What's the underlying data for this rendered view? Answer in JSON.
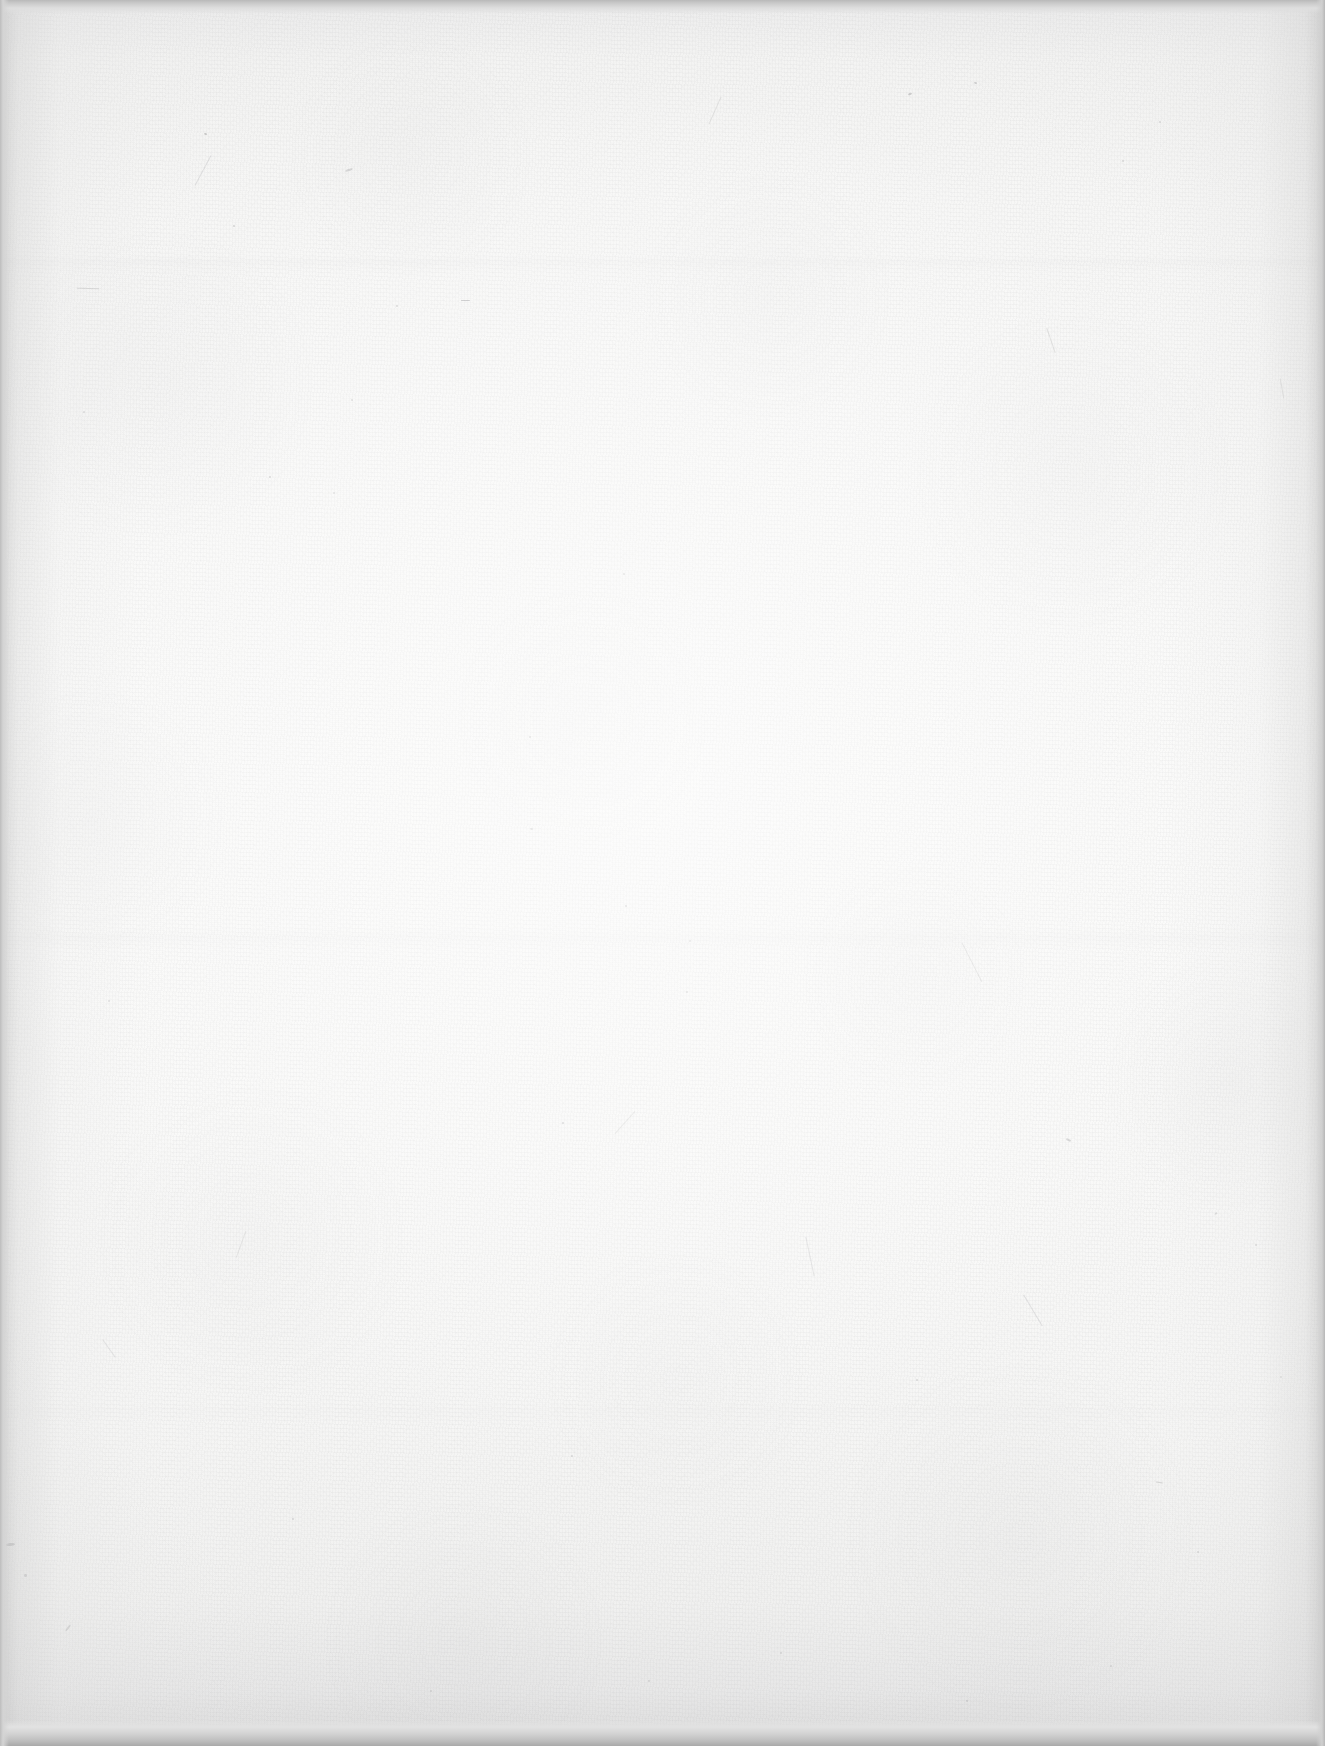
{
  "page": {
    "kind": "blank-scanned-page",
    "visible_text": "",
    "page_number": "",
    "header_text": "",
    "footer_text": "",
    "width_px": 1325,
    "height_px": 1746
  },
  "appearance": {
    "paper_base_color": "#fafaf9",
    "paper_edge_color": "#e8e8e8",
    "center_highlight_color": "#ffffff",
    "scanner_band_top_color": "#b9b9b9",
    "scanner_band_bottom_color": "#a9a9a9",
    "vignette_color": "#c4c4c4",
    "fiber_speck_color": "#8e8e90",
    "texture": "laid paper fibers with scattered dark specks",
    "lighting": "brightest near center, darkening toward all four edges"
  },
  "artifacts": {
    "specks": [
      {
        "x": 204,
        "y": 133,
        "w": 3,
        "h": 2,
        "rot": 18,
        "opacity": 0.42
      },
      {
        "x": 233,
        "y": 225,
        "w": 2,
        "h": 2,
        "rot": 0,
        "opacity": 0.35
      },
      {
        "x": 77,
        "y": 288,
        "w": 22,
        "h": 1,
        "rot": 2,
        "opacity": 0.3
      },
      {
        "x": 396,
        "y": 305,
        "w": 2,
        "h": 2,
        "rot": 0,
        "opacity": 0.33
      },
      {
        "x": 461,
        "y": 300,
        "w": 9,
        "h": 1,
        "rot": 1,
        "opacity": 0.46
      },
      {
        "x": 351,
        "y": 399,
        "w": 2,
        "h": 2,
        "rot": 0,
        "opacity": 0.28
      },
      {
        "x": 909,
        "y": 92,
        "w": 2,
        "h": 4,
        "rot": 65,
        "opacity": 0.4
      },
      {
        "x": 974,
        "y": 82,
        "w": 3,
        "h": 2,
        "rot": 20,
        "opacity": 0.36
      },
      {
        "x": 1122,
        "y": 160,
        "w": 2,
        "h": 2,
        "rot": 0,
        "opacity": 0.3
      },
      {
        "x": 1159,
        "y": 121,
        "w": 2,
        "h": 2,
        "rot": 0,
        "opacity": 0.27
      },
      {
        "x": 348,
        "y": 166,
        "w": 2,
        "h": 8,
        "rot": 72,
        "opacity": 0.31
      },
      {
        "x": 83,
        "y": 411,
        "w": 2,
        "h": 2,
        "rot": 0,
        "opacity": 0.29
      },
      {
        "x": 269,
        "y": 476,
        "w": 2,
        "h": 2,
        "rot": 0,
        "opacity": 0.34
      },
      {
        "x": 333,
        "y": 492,
        "w": 2,
        "h": 2,
        "rot": 0,
        "opacity": 0.26
      },
      {
        "x": 623,
        "y": 573,
        "w": 2,
        "h": 2,
        "rot": 0,
        "opacity": 0.3
      },
      {
        "x": 529,
        "y": 736,
        "w": 2,
        "h": 2,
        "rot": 0,
        "opacity": 0.32
      },
      {
        "x": 530,
        "y": 828,
        "w": 3,
        "h": 2,
        "rot": 14,
        "opacity": 0.3
      },
      {
        "x": 625,
        "y": 905,
        "w": 2,
        "h": 2,
        "rot": 0,
        "opacity": 0.36
      },
      {
        "x": 689,
        "y": 940,
        "w": 2,
        "h": 2,
        "rot": 0,
        "opacity": 0.28
      },
      {
        "x": 562,
        "y": 1122,
        "w": 2,
        "h": 2,
        "rot": 0,
        "opacity": 0.38
      },
      {
        "x": 686,
        "y": 991,
        "w": 2,
        "h": 2,
        "rot": 0,
        "opacity": 0.3
      },
      {
        "x": 1066,
        "y": 1139,
        "w": 5,
        "h": 2,
        "rot": 24,
        "opacity": 0.34
      },
      {
        "x": 1255,
        "y": 1244,
        "w": 2,
        "h": 2,
        "rot": 0,
        "opacity": 0.31
      },
      {
        "x": 1280,
        "y": 1376,
        "w": 2,
        "h": 2,
        "rot": 0,
        "opacity": 0.26
      },
      {
        "x": 1215,
        "y": 1212,
        "w": 2,
        "h": 3,
        "rot": 55,
        "opacity": 0.29
      },
      {
        "x": 916,
        "y": 1379,
        "w": 2,
        "h": 2,
        "rot": 0,
        "opacity": 0.28
      },
      {
        "x": 1197,
        "y": 1551,
        "w": 2,
        "h": 2,
        "rot": 0,
        "opacity": 0.3
      },
      {
        "x": 1156,
        "y": 1482,
        "w": 7,
        "h": 1,
        "rot": 8,
        "opacity": 0.33
      },
      {
        "x": 108,
        "y": 1000,
        "w": 2,
        "h": 2,
        "rot": 0,
        "opacity": 0.27
      },
      {
        "x": 9,
        "y": 1540,
        "w": 3,
        "h": 9,
        "rot": 85,
        "opacity": 0.44
      },
      {
        "x": 24,
        "y": 1574,
        "w": 3,
        "h": 3,
        "rot": 10,
        "opacity": 0.38
      },
      {
        "x": 67,
        "y": 1624,
        "w": 2,
        "h": 8,
        "rot": 38,
        "opacity": 0.32
      },
      {
        "x": 292,
        "y": 1518,
        "w": 2,
        "h": 2,
        "rot": 0,
        "opacity": 0.29
      },
      {
        "x": 571,
        "y": 1455,
        "w": 2,
        "h": 2,
        "rot": 0,
        "opacity": 0.27
      },
      {
        "x": 430,
        "y": 1690,
        "w": 2,
        "h": 2,
        "rot": 0,
        "opacity": 0.28
      },
      {
        "x": 648,
        "y": 1680,
        "w": 2,
        "h": 2,
        "rot": 0,
        "opacity": 0.26
      },
      {
        "x": 966,
        "y": 1700,
        "w": 2,
        "h": 2,
        "rot": 0,
        "opacity": 0.27
      },
      {
        "x": 780,
        "y": 1652,
        "w": 2,
        "h": 2,
        "rot": 0,
        "opacity": 0.25
      },
      {
        "x": 1110,
        "y": 1665,
        "w": 2,
        "h": 2,
        "rot": 0,
        "opacity": 0.26
      }
    ],
    "hairs": [
      {
        "x": 186,
        "y": 170,
        "w": 34,
        "h": 1,
        "rot": -62,
        "opacity": 0.22
      },
      {
        "x": 1038,
        "y": 340,
        "w": 26,
        "h": 1,
        "rot": 71,
        "opacity": 0.24
      },
      {
        "x": 790,
        "y": 1256,
        "w": 40,
        "h": 1,
        "rot": 78,
        "opacity": 0.2
      },
      {
        "x": 950,
        "y": 962,
        "w": 44,
        "h": 1,
        "rot": 63,
        "opacity": 0.21
      },
      {
        "x": 610,
        "y": 1122,
        "w": 30,
        "h": 1,
        "rot": -48,
        "opacity": 0.19
      },
      {
        "x": 1015,
        "y": 1310,
        "w": 36,
        "h": 1,
        "rot": 59,
        "opacity": 0.22
      },
      {
        "x": 227,
        "y": 1244,
        "w": 28,
        "h": 1,
        "rot": -70,
        "opacity": 0.18
      },
      {
        "x": 98,
        "y": 1348,
        "w": 22,
        "h": 1,
        "rot": 55,
        "opacity": 0.2
      },
      {
        "x": 1272,
        "y": 388,
        "w": 20,
        "h": 1,
        "rot": 80,
        "opacity": 0.23
      },
      {
        "x": 700,
        "y": 110,
        "w": 30,
        "h": 1,
        "rot": -66,
        "opacity": 0.19
      }
    ]
  }
}
